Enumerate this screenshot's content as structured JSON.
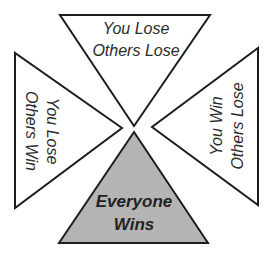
{
  "diagram": {
    "type": "outcome-quadrant",
    "colors": {
      "stroke": "#1e1e1e",
      "default_fill": "#ffffff",
      "highlight_fill": "#b4b4b4",
      "text": "#2b2b2b"
    },
    "triangles": [
      {
        "id": "top",
        "points": "60,15 210,15 134,126",
        "highlighted": false,
        "lines": [
          "You Lose",
          "Others Lose"
        ]
      },
      {
        "id": "left",
        "points": "15,53 15,208 122,128",
        "highlighted": false,
        "lines": [
          "You Lose",
          "Others Win"
        ]
      },
      {
        "id": "right",
        "points": "258,48 258,205 152,127",
        "highlighted": false,
        "lines": [
          "You Win",
          "Others Lose"
        ]
      },
      {
        "id": "bottom",
        "points": "134,132 59,243 208,243",
        "highlighted": true,
        "lines": [
          "Everyone",
          "Wins"
        ]
      }
    ]
  }
}
